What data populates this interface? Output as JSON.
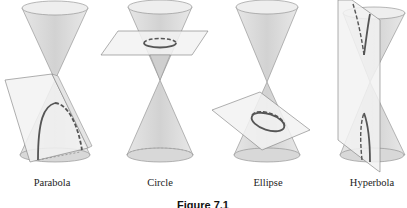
{
  "figure": {
    "caption": "Figure 7.1",
    "panels": [
      {
        "id": "parabola",
        "label": "Parabola"
      },
      {
        "id": "circle",
        "label": "Circle"
      },
      {
        "id": "ellipse",
        "label": "Ellipse"
      },
      {
        "id": "hyperbola",
        "label": "Hyperbola"
      }
    ]
  },
  "colors": {
    "cone_fill": "#d9d9d9",
    "cone_top": "#ededed",
    "cone_edge": "#8a8a8a",
    "plane_fill": "#f0f0f0",
    "plane_edge": "#7a7a7a",
    "curve": "#555555"
  }
}
